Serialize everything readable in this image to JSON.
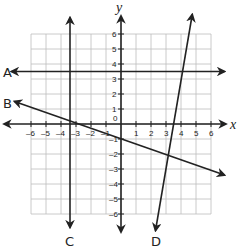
{
  "chart_data": {
    "type": "line",
    "title": "",
    "xlabel": "x",
    "ylabel": "y",
    "xlim": [
      -6,
      6
    ],
    "ylim": [
      -6,
      6
    ],
    "grid": true,
    "x_ticks": [
      "-6",
      "-5",
      "-4",
      "-3",
      "-2",
      "-1",
      "0",
      "1",
      "2",
      "3",
      "4",
      "5",
      "6"
    ],
    "y_ticks": [
      "6",
      "5",
      "4",
      "3",
      "2",
      "1",
      "-1",
      "-2",
      "-3",
      "-4",
      "-5",
      "-6"
    ],
    "origin_label": "0",
    "series": [
      {
        "name": "A",
        "kind": "horizontal",
        "equation": "y = 3.5",
        "points": [
          [
            -7.3,
            3.5
          ],
          [
            6.9,
            3.5
          ]
        ]
      },
      {
        "name": "B",
        "kind": "sloped",
        "equation": "y ≈ -0.35x - 1",
        "points": [
          [
            -7.1,
            1.5
          ],
          [
            6.9,
            -3.4
          ]
        ]
      },
      {
        "name": "C",
        "kind": "vertical",
        "equation": "x ≈ -3.4",
        "points": [
          [
            -3.4,
            7.1
          ],
          [
            -3.4,
            -6.9
          ]
        ]
      },
      {
        "name": "D",
        "kind": "sloped",
        "equation": "steep positive slope, x-intercept ≈ 3.9",
        "points": [
          [
            4.75,
            7.3
          ],
          [
            2.3,
            -7.1
          ]
        ]
      }
    ]
  },
  "labels": {
    "x_axis": "x",
    "y_axis": "y",
    "line_a": "A",
    "line_b": "B",
    "line_c": "C",
    "line_d": "D",
    "origin": "0"
  }
}
